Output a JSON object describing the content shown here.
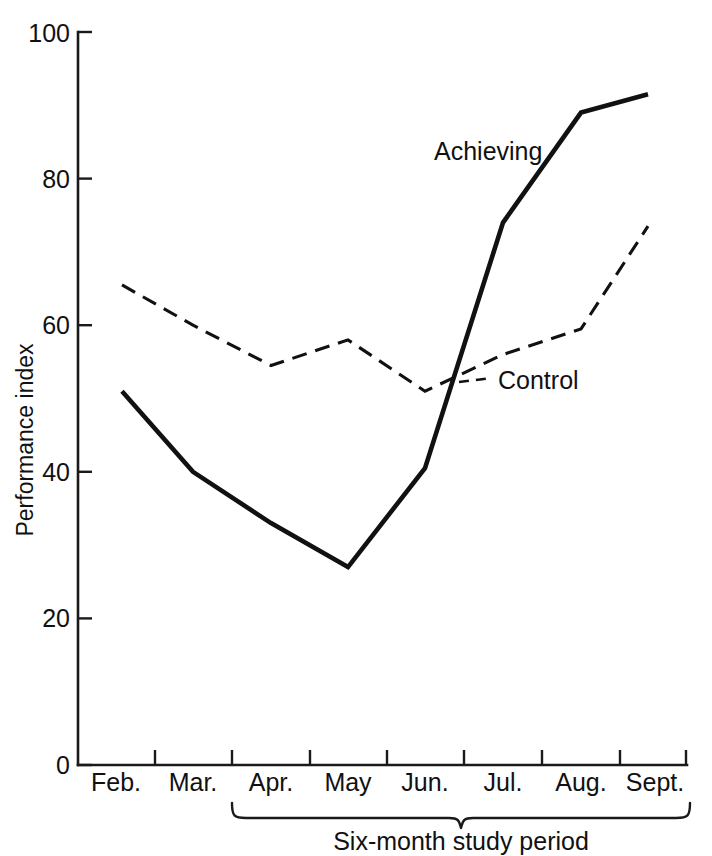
{
  "chart_data": {
    "type": "line",
    "title": "",
    "xlabel": "Six-month study period",
    "ylabel": "Performance index",
    "categories": [
      "Feb.",
      "Mar.",
      "Apr.",
      "May",
      "Jun.",
      "Jul.",
      "Aug.",
      "Sept."
    ],
    "ylim": [
      0,
      100
    ],
    "yticks": [
      0,
      20,
      40,
      60,
      80,
      100
    ],
    "ytick_labels": [
      "0",
      "20",
      "40",
      "60",
      "80",
      "100"
    ],
    "grid": false,
    "legend_position": "inline-annotation",
    "series": [
      {
        "name": "Achieving",
        "style": "solid",
        "color": "#111111",
        "values": [
          51,
          40,
          33,
          27,
          40.5,
          74,
          89,
          91.5
        ]
      },
      {
        "name": "Control",
        "style": "dashed",
        "color": "#111111",
        "values": [
          65.5,
          60,
          54.5,
          58,
          51,
          56,
          59.5,
          73.5
        ]
      }
    ],
    "annotations": [
      {
        "text": "Achieving",
        "target_series": "Achieving",
        "near_category": "Jul."
      },
      {
        "text": "Control",
        "target_series": "Control",
        "near_category": "Jun."
      },
      {
        "text": "Six-month study period",
        "span": [
          "Apr.",
          "Sept."
        ],
        "kind": "brace-label"
      }
    ]
  },
  "axes": {
    "y_axis_title": "Performance index",
    "x_brace_label": "Six-month study period"
  }
}
